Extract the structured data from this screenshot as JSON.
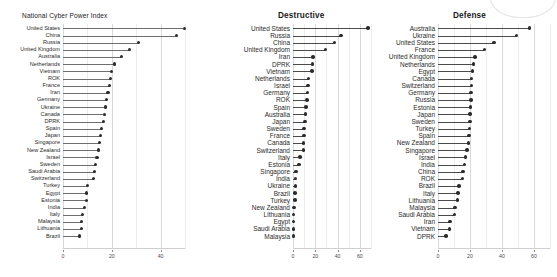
{
  "figure": {
    "background_color": "#ffffff",
    "dot_color": "#2b2b2b",
    "stem_color": "#6e6e6e",
    "grid_color": "#d9d9d9"
  },
  "panels": [
    {
      "title": "National Cyber Power Index"
    },
    {
      "title": "Destructive"
    },
    {
      "title": "Defense"
    }
  ],
  "chart_data": [
    {
      "type": "bar",
      "title": "National Cyber Power Index",
      "xlabel": "",
      "ylabel": "",
      "xlim": [
        0,
        50
      ],
      "xticks": [
        0,
        20,
        40
      ],
      "xtick_labels": [
        "0",
        "20",
        "40"
      ],
      "grid": true,
      "orientation": "horizontal",
      "style": "lollipop",
      "categories": [
        "United States",
        "China",
        "Russia",
        "United Kingdom",
        "Australia",
        "Netherlands",
        "Vietnam",
        "ROK",
        "France",
        "Iran",
        "Germany",
        "Ukraine",
        "Canada",
        "DPRK",
        "Spain",
        "Japan",
        "Singapore",
        "New Zealand",
        "Israel",
        "Sweden",
        "Saudi Arabia",
        "Switzerland",
        "Turkey",
        "Egypt",
        "Estonia",
        "India",
        "Italy",
        "Malaysia",
        "Lithuania",
        "Brazil"
      ],
      "values": [
        50.0,
        46.5,
        31.0,
        27.5,
        24.0,
        21.0,
        20.0,
        19.5,
        19.0,
        18.5,
        18.0,
        17.5,
        17.0,
        16.5,
        16.0,
        15.5,
        15.0,
        14.5,
        14.0,
        13.5,
        13.0,
        12.5,
        10.0,
        9.8,
        9.7,
        8.8,
        8.2,
        7.8,
        7.5,
        6.8
      ]
    },
    {
      "type": "bar",
      "title": "Destructive",
      "xlabel": "",
      "ylabel": "",
      "xlim": [
        0,
        70
      ],
      "xticks": [
        0,
        20,
        40,
        60
      ],
      "xtick_labels": [
        "0",
        "20",
        "40",
        "60"
      ],
      "grid": true,
      "orientation": "horizontal",
      "style": "lollipop",
      "categories": [
        "United States",
        "Russia",
        "China",
        "United Kingdom",
        "Iran",
        "DPRK",
        "Vietnam",
        "Netherlands",
        "Israel",
        "Germany",
        "ROK",
        "Spain",
        "Australia",
        "Japan",
        "Sweden",
        "France",
        "Canada",
        "Switzerland",
        "Italy",
        "Estonia",
        "Singapore",
        "India",
        "Ukraine",
        "Brazil",
        "Turkey",
        "New Zealand",
        "Lithuania",
        "Egypt",
        "Saudi Arabia",
        "Malaysia"
      ],
      "values": [
        67.0,
        43.0,
        37.0,
        29.0,
        18.0,
        17.5,
        17.0,
        14.0,
        13.5,
        13.0,
        12.5,
        11.5,
        11.0,
        10.5,
        10.0,
        9.8,
        9.5,
        9.2,
        6.0,
        5.5,
        2.5,
        2.2,
        2.0,
        1.8,
        1.6,
        0.6,
        0.5,
        0.4,
        0.35,
        0.3
      ]
    },
    {
      "type": "bar",
      "title": "Defense",
      "xlabel": "",
      "ylabel": "",
      "xlim": [
        0,
        70
      ],
      "xticks": [
        0,
        20,
        40,
        60
      ],
      "xtick_labels": [
        "0",
        "20",
        "40",
        "60"
      ],
      "grid": true,
      "orientation": "horizontal",
      "style": "lollipop",
      "categories": [
        "Australia",
        "Ukraine",
        "United States",
        "France",
        "United Kingdom",
        "Netherlands",
        "Egypt",
        "Canada",
        "Switzerland",
        "Germany",
        "Russia",
        "Estonia",
        "Japan",
        "Sweden",
        "Turkey",
        "Spain",
        "New Zealand",
        "Singapore",
        "Israel",
        "India",
        "China",
        "ROK",
        "Brazil",
        "Italy",
        "Lithuania",
        "Malaysia",
        "Saudi Arabia",
        "Iran",
        "Vietnam",
        "DPRK"
      ],
      "values": [
        57.0,
        49.0,
        35.0,
        29.0,
        23.0,
        22.0,
        21.5,
        21.0,
        20.8,
        20.6,
        20.4,
        20.2,
        20.0,
        19.8,
        19.5,
        19.2,
        19.0,
        18.0,
        17.0,
        16.5,
        15.5,
        15.2,
        13.0,
        12.5,
        12.0,
        10.5,
        10.2,
        7.5,
        7.2,
        5.0
      ]
    }
  ]
}
